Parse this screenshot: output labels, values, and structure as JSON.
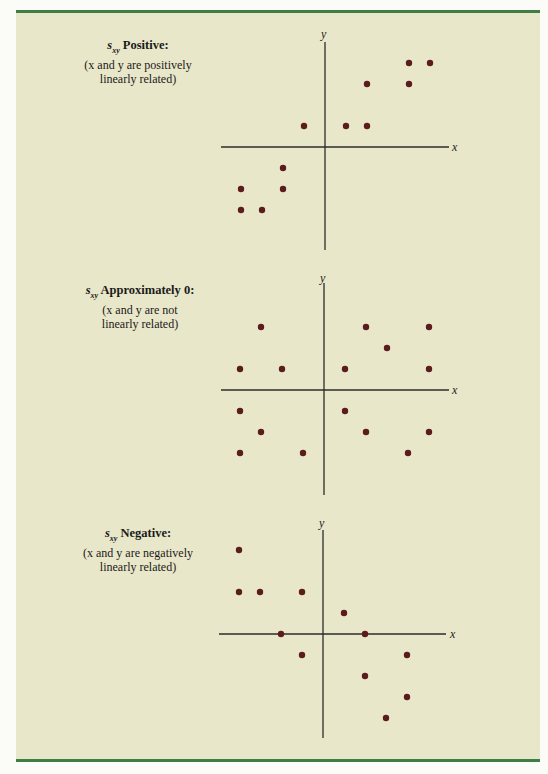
{
  "colors": {
    "background": "#e9e7c9",
    "rule": "#3f7d45",
    "axis": "#2b2b2b",
    "point": "#5a1c1c"
  },
  "panels": [
    {
      "sxy_symbol": "s",
      "sxy_sub": "xy",
      "heading": "Positive:",
      "line1": "(x and y are positively",
      "line2": "linearly related)",
      "x_label": "x",
      "y_label": "y"
    },
    {
      "sxy_symbol": "s",
      "sxy_sub": "xy",
      "heading": "Approximately 0:",
      "line1": "(x and y are not",
      "line2": "linearly related)",
      "x_label": "x",
      "y_label": "y"
    },
    {
      "sxy_symbol": "s",
      "sxy_sub": "xy",
      "heading": "Negative:",
      "line1": "(x and y are negatively",
      "line2": "linearly related)",
      "x_label": "x",
      "y_label": "y"
    }
  ],
  "chart_data": [
    {
      "type": "scatter",
      "title": "s_xy Positive: (x and y are positively linearly related)",
      "xlabel": "x",
      "ylabel": "y",
      "grid": false,
      "xlim": [
        -5,
        6
      ],
      "ylim": [
        -5,
        5
      ],
      "points": [
        [
          4,
          4
        ],
        [
          5,
          4
        ],
        [
          2,
          3
        ],
        [
          4,
          3
        ],
        [
          -1,
          1
        ],
        [
          1,
          1
        ],
        [
          2,
          1
        ],
        [
          -2,
          -1
        ],
        [
          -4,
          -2
        ],
        [
          -2,
          -2
        ],
        [
          -4,
          -3
        ],
        [
          -3,
          -3
        ]
      ]
    },
    {
      "type": "scatter",
      "title": "s_xy Approximately 0: (x and y are not linearly related)",
      "xlabel": "x",
      "ylabel": "y",
      "grid": false,
      "xlim": [
        -5,
        6
      ],
      "ylim": [
        -5,
        5
      ],
      "points": [
        [
          -3,
          3
        ],
        [
          2,
          3
        ],
        [
          5,
          3
        ],
        [
          3,
          2
        ],
        [
          -4,
          1
        ],
        [
          -2,
          1
        ],
        [
          1,
          1
        ],
        [
          5,
          1
        ],
        [
          -4,
          -1
        ],
        [
          1,
          -1
        ],
        [
          -3,
          -2
        ],
        [
          2,
          -2
        ],
        [
          5,
          -2
        ],
        [
          -4,
          -3
        ],
        [
          -1,
          -3
        ],
        [
          4,
          -3
        ]
      ]
    },
    {
      "type": "scatter",
      "title": "s_xy Negative: (x and y are negatively linearly related)",
      "xlabel": "x",
      "ylabel": "y",
      "grid": false,
      "xlim": [
        -5,
        6
      ],
      "ylim": [
        -5,
        5
      ],
      "points": [
        [
          -4,
          4
        ],
        [
          -4,
          2
        ],
        [
          -3,
          2
        ],
        [
          -1,
          2
        ],
        [
          1,
          1
        ],
        [
          -2,
          0
        ],
        [
          2,
          0
        ],
        [
          -1,
          -1
        ],
        [
          4,
          -1
        ],
        [
          2,
          -2
        ],
        [
          4,
          -3
        ],
        [
          3,
          -4
        ]
      ]
    }
  ]
}
